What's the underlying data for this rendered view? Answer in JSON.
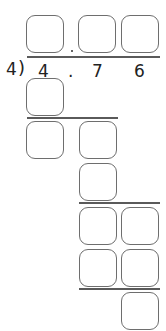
{
  "problem": {
    "type": "long-division",
    "divisor": "4",
    "bracket": ")",
    "dividend_digits": [
      "4",
      ".",
      "7",
      "6"
    ]
  },
  "quotient": {
    "boxes": [
      {
        "id": "q-ones",
        "value": ""
      },
      {
        "id": "q-tenths",
        "value": ""
      },
      {
        "id": "q-hundredths",
        "value": ""
      }
    ],
    "decimal_point": "."
  },
  "work_steps": [
    {
      "row": 1,
      "boxes": [
        {
          "value": ""
        }
      ]
    },
    {
      "row": 2,
      "boxes": [
        {
          "value": ""
        },
        {
          "value": ""
        }
      ]
    },
    {
      "row": 3,
      "boxes": [
        {
          "value": ""
        }
      ]
    },
    {
      "row": 4,
      "boxes": [
        {
          "value": ""
        },
        {
          "value": ""
        }
      ]
    },
    {
      "row": 5,
      "boxes": [
        {
          "value": ""
        },
        {
          "value": ""
        }
      ]
    },
    {
      "row": 6,
      "boxes": [
        {
          "value": ""
        }
      ]
    }
  ],
  "colors": {
    "box_stroke": "#6e6e6e",
    "rule_line": "#5a5a5a",
    "text": "#222222"
  }
}
